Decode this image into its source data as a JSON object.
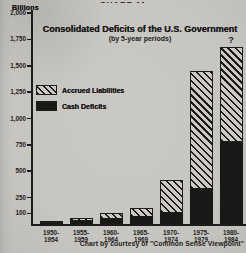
{
  "page": {
    "clipped_header": "CHART 11"
  },
  "chart_data": {
    "type": "bar",
    "stacked": true,
    "title": "Consolidated Deficits of the U.S. Government",
    "subtitle": "(by 5-year periods)",
    "unit_label": "Billions",
    "caption": "Chart by courtesy of \"Common Sense Viewpoint\"",
    "categories": [
      "1950-1954",
      "1955-1959",
      "1960-1964",
      "1965-1969",
      "1970-1974",
      "1975-1979",
      "1980-1984"
    ],
    "series": [
      {
        "name": "Accrued Liabilities",
        "style": "hatched",
        "values": [
          10,
          30,
          55,
          80,
          320,
          1120,
          900
        ]
      },
      {
        "name": "Cash Deficits",
        "style": "solid-black",
        "values": [
          20,
          30,
          50,
          70,
          100,
          330,
          775
        ]
      }
    ],
    "approx_totals": [
      30,
      60,
      105,
      150,
      420,
      1450,
      1675
    ],
    "annotations": [
      {
        "bar_index": 6,
        "text": "?"
      }
    ],
    "y_ticks": [
      "2,000",
      "1,750",
      "1,500",
      "1,250",
      "1,000",
      "750",
      "500",
      "250",
      "100"
    ],
    "y_tick_values": [
      2000,
      1750,
      1500,
      1250,
      1000,
      750,
      500,
      250,
      100
    ],
    "ylim": [
      0,
      2000
    ],
    "xlabel": "",
    "ylabel": "Billions",
    "legend_position": "middle-left",
    "grid": false
  },
  "colors": {
    "paper": "#c8c6c1",
    "ink": "#1c1c1c",
    "cash_bar": "#181816"
  }
}
